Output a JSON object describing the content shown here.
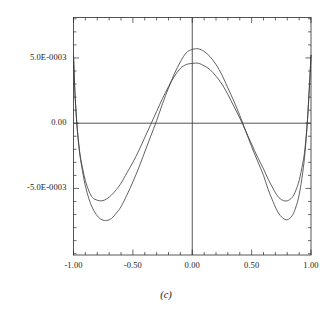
{
  "figure": {
    "caption": "(c)",
    "background": "#ffffff",
    "line_color": "#3a3a3a",
    "axis_color": "#2b2b2b"
  },
  "chart_data": {
    "type": "line",
    "title": "",
    "xlabel": "",
    "ylabel": "",
    "xlim": [
      -1.0,
      1.0
    ],
    "ylim": [
      -0.0101,
      0.0081
    ],
    "grid": false,
    "legend": null,
    "frame": "box",
    "x_ticks_major": [
      -1.0,
      -0.5,
      0.0,
      0.5,
      1.0
    ],
    "x_tick_labels": [
      "-1.00",
      "-0.50",
      "0.00",
      "0.50",
      "1.00"
    ],
    "x_minor_step": 0.1,
    "y_ticks_major": [
      -0.005,
      0.0,
      0.005
    ],
    "y_tick_labels": [
      "-5.0E-0003",
      "0.00",
      "5.0E-0003"
    ],
    "y_minor_step": 0.001,
    "axis_lines": {
      "x_axis_at_y": 0.0,
      "y_axis_at_x": 0.0
    },
    "series": [
      {
        "name": "curve-1",
        "peak_value": 0.0057,
        "peak_x": 0.07,
        "min_value": -0.0074,
        "min_x": 0.74,
        "x": [
          -1.0,
          -0.99,
          -0.98,
          -0.97,
          -0.96,
          -0.95,
          -0.94,
          -0.92,
          -0.9,
          -0.87,
          -0.84,
          -0.8,
          -0.76,
          -0.72,
          -0.68,
          -0.64,
          -0.6,
          -0.55,
          -0.5,
          -0.45,
          -0.4,
          -0.35,
          -0.3,
          -0.25,
          -0.2,
          -0.15,
          -0.1,
          -0.05,
          0.0,
          0.05,
          0.1,
          0.15,
          0.2,
          0.25,
          0.3,
          0.35,
          0.4,
          0.45,
          0.5,
          0.55,
          0.6,
          0.64,
          0.68,
          0.72,
          0.76,
          0.8,
          0.84,
          0.87,
          0.9,
          0.93,
          0.95,
          0.97,
          0.98,
          0.99,
          1.0
        ],
        "y": [
          0.0052,
          0.0028,
          0.0011,
          -0.0002,
          -0.0012,
          -0.0021,
          -0.0028,
          -0.0039,
          -0.0048,
          -0.0058,
          -0.0065,
          -0.0071,
          -0.0074,
          -0.00745,
          -0.0073,
          -0.0069,
          -0.0064,
          -0.0055,
          -0.0045,
          -0.0034,
          -0.0022,
          -0.001,
          0.0002,
          0.0015,
          0.0027,
          0.0038,
          0.0047,
          0.0054,
          0.00565,
          0.0057,
          0.0055,
          0.0051,
          0.0045,
          0.0037,
          0.0027,
          0.0017,
          0.0006,
          -0.0006,
          -0.0018,
          -0.0029,
          -0.004,
          -0.0051,
          -0.006,
          -0.0068,
          -0.00725,
          -0.0074,
          -0.0071,
          -0.0065,
          -0.0055,
          -0.0038,
          -0.0022,
          0.0002,
          0.0018,
          0.0034,
          0.0052
        ]
      },
      {
        "name": "curve-2",
        "peak_value": 0.0046,
        "peak_x": 0.05,
        "min_value": -0.0059,
        "min_x": 0.73,
        "x": [
          -1.0,
          -0.99,
          -0.98,
          -0.97,
          -0.96,
          -0.95,
          -0.94,
          -0.92,
          -0.9,
          -0.87,
          -0.84,
          -0.8,
          -0.76,
          -0.72,
          -0.68,
          -0.64,
          -0.6,
          -0.55,
          -0.5,
          -0.45,
          -0.4,
          -0.35,
          -0.3,
          -0.25,
          -0.2,
          -0.15,
          -0.1,
          -0.05,
          0.0,
          0.05,
          0.1,
          0.15,
          0.2,
          0.25,
          0.3,
          0.35,
          0.4,
          0.45,
          0.5,
          0.55,
          0.6,
          0.64,
          0.68,
          0.72,
          0.76,
          0.8,
          0.84,
          0.87,
          0.9,
          0.93,
          0.95,
          0.97,
          0.98,
          0.99,
          1.0
        ],
        "y": [
          0.0052,
          0.0027,
          0.001,
          -0.0003,
          -0.0013,
          -0.0021,
          -0.0027,
          -0.0036,
          -0.0044,
          -0.0052,
          -0.0057,
          -0.0059,
          -0.00595,
          -0.0058,
          -0.0055,
          -0.0051,
          -0.0046,
          -0.0038,
          -0.003,
          -0.0021,
          -0.0011,
          -0.0001,
          0.0009,
          0.0019,
          0.0028,
          0.0036,
          0.0042,
          0.0045,
          0.00458,
          0.0046,
          0.0044,
          0.0041,
          0.0036,
          0.003,
          0.0022,
          0.0013,
          0.0004,
          -0.0006,
          -0.0016,
          -0.0026,
          -0.0035,
          -0.0043,
          -0.005,
          -0.0056,
          -0.0059,
          -0.00595,
          -0.0057,
          -0.0052,
          -0.0044,
          -0.0031,
          -0.0019,
          0.0002,
          0.0017,
          0.0033,
          0.0052
        ]
      }
    ]
  }
}
